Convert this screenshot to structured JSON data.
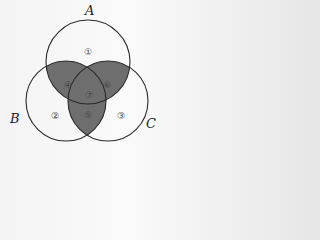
{
  "sets": [
    {
      "label": "A",
      "cx": 88,
      "cy": 62,
      "r": 42,
      "lx": 85,
      "ly": 15
    },
    {
      "label": "B",
      "cx": 66,
      "cy": 101,
      "r": 40,
      "lx": 10,
      "ly": 123
    },
    {
      "label": "C",
      "cx": 108,
      "cy": 101,
      "r": 40,
      "lx": 146,
      "ly": 128
    }
  ],
  "regions": [
    {
      "id": "1",
      "label": "①",
      "x": 88,
      "y": 52,
      "shaded": false
    },
    {
      "id": "2",
      "label": "②",
      "x": 55,
      "y": 116,
      "shaded": false
    },
    {
      "id": "3",
      "label": "③",
      "x": 121,
      "y": 116,
      "shaded": false
    },
    {
      "id": "4",
      "label": "④",
      "x": 68,
      "y": 85,
      "shaded": true
    },
    {
      "id": "5",
      "label": "⑤",
      "x": 88,
      "y": 115,
      "shaded": true
    },
    {
      "id": "6",
      "label": "⑥",
      "x": 107,
      "y": 85,
      "shaded": true
    },
    {
      "id": "7",
      "label": "⑦",
      "x": 89,
      "y": 95,
      "shaded": true
    }
  ],
  "colors": {
    "shade": "#6e6e6e",
    "stroke": "#2a2a2a",
    "fill": "#ffffff"
  }
}
